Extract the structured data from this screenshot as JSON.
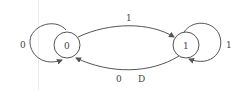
{
  "diagram": {
    "type": "state-machine",
    "nodes": [
      {
        "id": "s0",
        "label": "0"
      },
      {
        "id": "s1",
        "label": "1"
      }
    ],
    "edges": [
      {
        "from": "s0",
        "to": "s0",
        "label": "0"
      },
      {
        "from": "s0",
        "to": "s1",
        "label": "1"
      },
      {
        "from": "s1",
        "to": "s0",
        "label": "0",
        "output": "D"
      },
      {
        "from": "s1",
        "to": "s1",
        "label": "1"
      }
    ],
    "colors": {
      "stroke": "#555555",
      "text": "#444444",
      "background": "#ffffff"
    }
  }
}
